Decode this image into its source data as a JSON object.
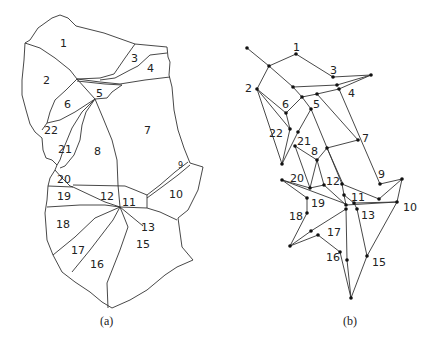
{
  "figure": {
    "panel_a": {
      "caption": "(a)",
      "description": "Map partitioned into 22 numbered regions",
      "regions": [
        {
          "id": "1",
          "x": 60,
          "y": 47
        },
        {
          "id": "2",
          "x": 43,
          "y": 84
        },
        {
          "id": "3",
          "x": 131,
          "y": 62
        },
        {
          "id": "4",
          "x": 147,
          "y": 72
        },
        {
          "id": "5",
          "x": 96,
          "y": 97
        },
        {
          "id": "6",
          "x": 64,
          "y": 108
        },
        {
          "id": "7",
          "x": 144,
          "y": 134
        },
        {
          "id": "8",
          "x": 94,
          "y": 155
        },
        {
          "id": "9",
          "x": 178,
          "y": 168
        },
        {
          "id": "10",
          "x": 169,
          "y": 198
        },
        {
          "id": "11",
          "x": 126,
          "y": 206
        },
        {
          "id": "12",
          "x": 100,
          "y": 200
        },
        {
          "id": "13",
          "x": 141,
          "y": 231
        },
        {
          "id": "15",
          "x": 139,
          "y": 248
        },
        {
          "id": "16",
          "x": 93,
          "y": 268
        },
        {
          "id": "17",
          "x": 74,
          "y": 254
        },
        {
          "id": "18",
          "x": 55,
          "y": 228
        },
        {
          "id": "19",
          "x": 56,
          "y": 200
        },
        {
          "id": "20",
          "x": 56,
          "y": 184
        },
        {
          "id": "21",
          "x": 58,
          "y": 152
        },
        {
          "id": "22",
          "x": 47,
          "y": 133
        }
      ]
    },
    "panel_b": {
      "caption": "(b)",
      "description": "Adjacency graph derived from the map",
      "labels": [
        {
          "id": "1",
          "x": 293,
          "y": 51
        },
        {
          "id": "2",
          "x": 245,
          "y": 92
        },
        {
          "id": "3",
          "x": 330,
          "y": 74
        },
        {
          "id": "4",
          "x": 348,
          "y": 97
        },
        {
          "id": "5",
          "x": 313,
          "y": 108
        },
        {
          "id": "6",
          "x": 282,
          "y": 108
        },
        {
          "id": "7",
          "x": 362,
          "y": 142
        },
        {
          "id": "8",
          "x": 311,
          "y": 155
        },
        {
          "id": "9",
          "x": 378,
          "y": 178
        },
        {
          "id": "10",
          "x": 403,
          "y": 211
        },
        {
          "id": "11",
          "x": 351,
          "y": 201
        },
        {
          "id": "12",
          "x": 326,
          "y": 185
        },
        {
          "id": "13",
          "x": 361,
          "y": 219
        },
        {
          "id": "15",
          "x": 372,
          "y": 266
        },
        {
          "id": "16",
          "x": 326,
          "y": 261
        },
        {
          "id": "17",
          "x": 327,
          "y": 236
        },
        {
          "id": "18",
          "x": 289,
          "y": 220
        },
        {
          "id": "19",
          "x": 311,
          "y": 207
        },
        {
          "id": "20",
          "x": 290,
          "y": 182
        },
        {
          "id": "21",
          "x": 297,
          "y": 145
        },
        {
          "id": "22",
          "x": 269,
          "y": 137
        }
      ]
    }
  }
}
